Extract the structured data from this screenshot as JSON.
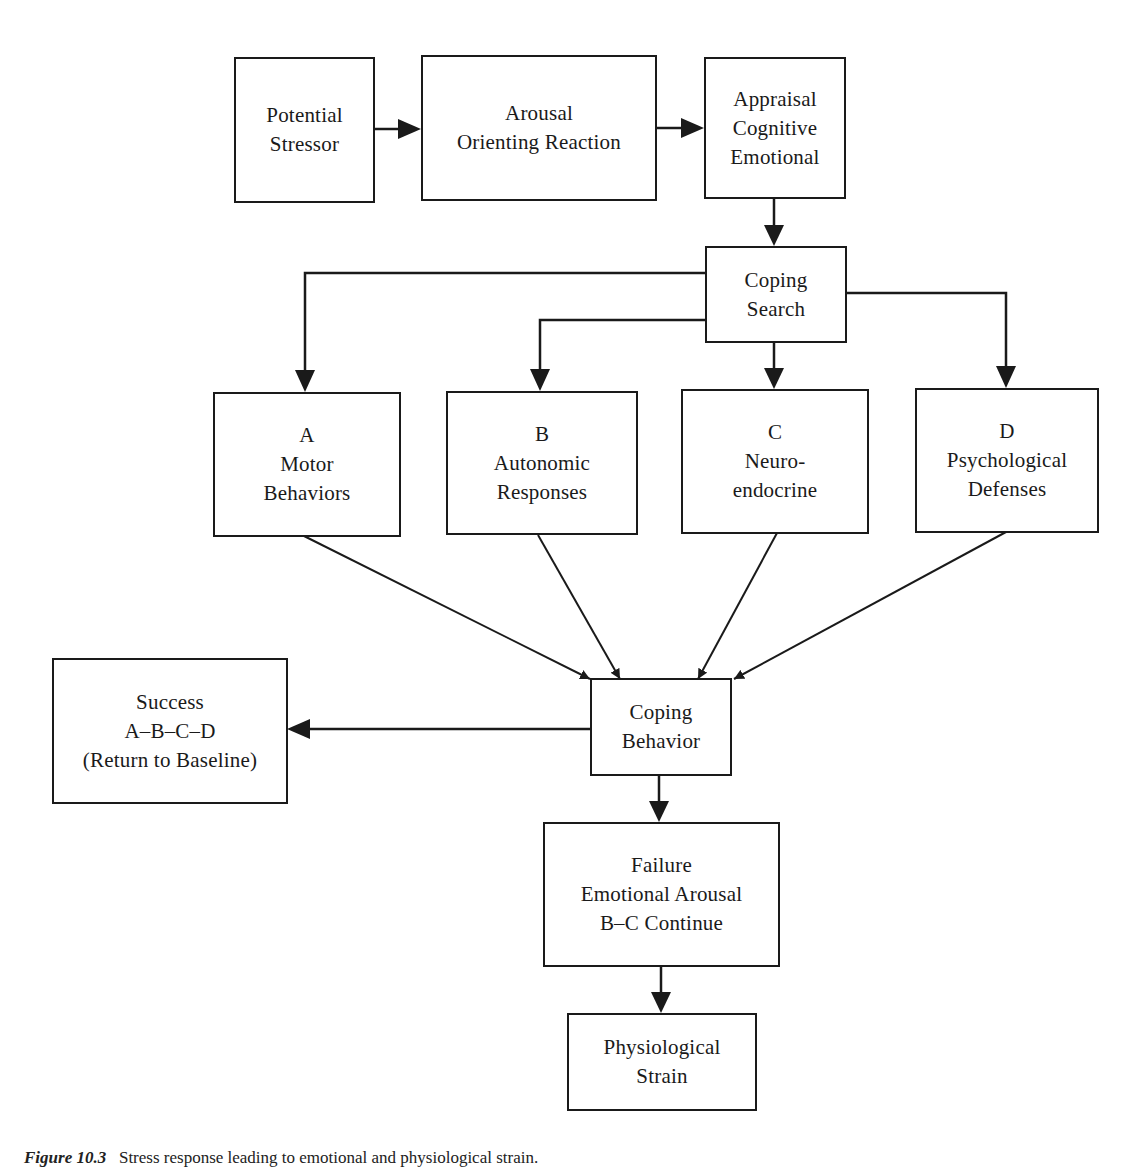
{
  "figure": {
    "type": "flowchart",
    "nodes": {
      "potential_stressor": {
        "lines": [
          "Potential",
          "Stressor"
        ]
      },
      "arousal": {
        "lines": [
          "Arousal",
          "Orienting Reaction"
        ]
      },
      "appraisal": {
        "lines": [
          "Appraisal",
          "Cognitive",
          "Emotional"
        ]
      },
      "coping_search": {
        "lines": [
          "Coping",
          "Search"
        ]
      },
      "motor": {
        "lines": [
          "A",
          "Motor",
          "Behaviors"
        ]
      },
      "autonomic": {
        "lines": [
          "B",
          "Autonomic",
          "Responses"
        ]
      },
      "neuroendocrine": {
        "lines": [
          "C",
          "Neuro-",
          "endocrine"
        ]
      },
      "psychological": {
        "lines": [
          "D",
          "Psychological",
          "Defenses"
        ]
      },
      "coping_behavior": {
        "lines": [
          "Coping",
          "Behavior"
        ]
      },
      "success": {
        "lines": [
          "Success",
          "A–B–C–D",
          "(Return to Baseline)"
        ]
      },
      "failure": {
        "lines": [
          "Failure",
          "Emotional Arousal",
          "B–C Continue"
        ]
      },
      "strain": {
        "lines": [
          "Physiological",
          "Strain"
        ]
      }
    },
    "edges": [
      [
        "potential_stressor",
        "arousal"
      ],
      [
        "arousal",
        "appraisal"
      ],
      [
        "appraisal",
        "coping_search"
      ],
      [
        "coping_search",
        "motor"
      ],
      [
        "coping_search",
        "autonomic"
      ],
      [
        "coping_search",
        "neuroendocrine"
      ],
      [
        "coping_search",
        "psychological"
      ],
      [
        "motor",
        "coping_behavior"
      ],
      [
        "autonomic",
        "coping_behavior"
      ],
      [
        "neuroendocrine",
        "coping_behavior"
      ],
      [
        "psychological",
        "coping_behavior"
      ],
      [
        "coping_behavior",
        "success"
      ],
      [
        "coping_behavior",
        "failure"
      ],
      [
        "failure",
        "strain"
      ]
    ],
    "caption": {
      "prefix": "Figure 10.3",
      "text": "Stress response leading to emotional and physiological strain."
    },
    "colors": {
      "stroke": "#1a1a1a",
      "background": "#ffffff"
    }
  }
}
